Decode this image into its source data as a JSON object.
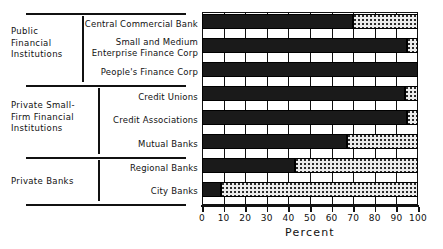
{
  "chart_data": {
    "type": "bar",
    "orientation": "horizontal",
    "stacked": true,
    "title": "",
    "xlabel": "Percent",
    "ylabel": "",
    "xlim": [
      0,
      100
    ],
    "xticks": [
      0,
      10,
      20,
      30,
      40,
      50,
      60,
      70,
      80,
      90,
      100
    ],
    "grid": true,
    "grid_axis": "x",
    "legend": null,
    "categories": [
      "Central Commercial Bank",
      "Small and Medium\nEnterprise Finance Corp",
      "People's Finance Corp",
      "Credit Unions",
      "Credit Associations",
      "Mutual Banks",
      "Regional Banks",
      "City Banks"
    ],
    "series": [
      {
        "name": "filled",
        "values": [
          70,
          95,
          100,
          94,
          95,
          67,
          43,
          9
        ]
      },
      {
        "name": "remainder",
        "values": [
          30,
          5,
          0,
          6,
          5,
          33,
          57,
          91
        ]
      }
    ],
    "values": [
      70,
      95,
      100,
      94,
      95,
      67,
      43,
      9
    ],
    "groups": [
      {
        "label": "Public\nFinancial\nInstitutions",
        "members": [
          "Central Commercial Bank",
          "Small and Medium\nEnterprise Finance Corp",
          "People's Finance Corp"
        ]
      },
      {
        "label": "Private Small-\nFirm Financial\nInstitutions",
        "members": [
          "Credit Unions",
          "Credit Associations",
          "Mutual Banks"
        ]
      },
      {
        "label": "Private Banks",
        "members": [
          "Regional Banks",
          "City Banks"
        ]
      }
    ],
    "colors": {
      "filled": "#1a1a1a",
      "remainder": "#ececec",
      "axis": "#111111",
      "background": "#ffffff"
    }
  },
  "axis": {
    "title": "Percent",
    "ticks": [
      {
        "value": 0,
        "label": "0"
      },
      {
        "value": 10,
        "label": "10"
      },
      {
        "value": 20,
        "label": "20"
      },
      {
        "value": 30,
        "label": "30"
      },
      {
        "value": 40,
        "label": "40"
      },
      {
        "value": 50,
        "label": "50"
      },
      {
        "value": 60,
        "label": "60"
      },
      {
        "value": 70,
        "label": "70"
      },
      {
        "value": 80,
        "label": "80"
      },
      {
        "value": 90,
        "label": "90"
      },
      {
        "value": 100,
        "label": "100"
      }
    ]
  },
  "groups": [
    {
      "label": "Public\nFinancial\nInstitutions"
    },
    {
      "label": "Private Small-\nFirm Financial\nInstitutions"
    },
    {
      "label": "Private Banks"
    }
  ],
  "series_labels": [
    {
      "label": "Central Commercial Bank"
    },
    {
      "label": "Small and Medium\nEnterprise Finance Corp"
    },
    {
      "label": "People's Finance Corp"
    },
    {
      "label": "Credit Unions"
    },
    {
      "label": "Credit Associations"
    },
    {
      "label": "Mutual Banks"
    },
    {
      "label": "Regional Banks"
    },
    {
      "label": "City Banks"
    }
  ]
}
